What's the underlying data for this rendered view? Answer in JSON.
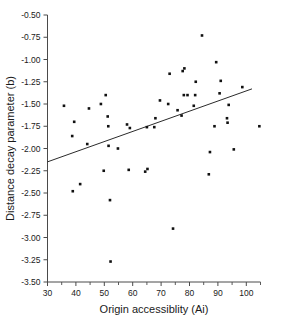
{
  "chart_data": {
    "type": "scatter",
    "title": "",
    "xlabel": "Origin accessiblity (Ai)",
    "ylabel": "Distance decay parameter (b)",
    "xlim": [
      30,
      105
    ],
    "ylim": [
      -3.5,
      -0.5
    ],
    "grid": false,
    "legend": null,
    "x_ticks": [
      30,
      40,
      50,
      60,
      70,
      80,
      90,
      100
    ],
    "x_tick_labels": [
      "30",
      "40",
      "50",
      "60",
      "70",
      "80",
      "90",
      "100"
    ],
    "x_minor_ticks": [
      35,
      45,
      55,
      65,
      75,
      85,
      95,
      105
    ],
    "y_ticks": [
      -0.5,
      -0.75,
      -1.0,
      -1.25,
      -1.5,
      -1.75,
      -2.0,
      -2.25,
      -2.5,
      -2.75,
      -3.0,
      -3.25,
      -3.5
    ],
    "y_tick_labels": [
      "-0.50",
      "-0.75",
      "-1.00",
      "-1.25",
      "-1.50",
      "-1.75",
      "-2.00",
      "-2.25",
      "-2.50",
      "-2.75",
      "-3.00",
      "-3.25",
      "-3.50"
    ],
    "marker": "square",
    "marker_color": "#111111",
    "points": [
      {
        "x": 35.8,
        "y": -1.52
      },
      {
        "x": 38.7,
        "y": -1.86
      },
      {
        "x": 38.9,
        "y": -2.48
      },
      {
        "x": 39.4,
        "y": -1.7
      },
      {
        "x": 41.5,
        "y": -2.4
      },
      {
        "x": 44.0,
        "y": -1.95
      },
      {
        "x": 44.6,
        "y": -1.55
      },
      {
        "x": 48.8,
        "y": -1.5
      },
      {
        "x": 49.8,
        "y": -2.25
      },
      {
        "x": 50.5,
        "y": -1.4
      },
      {
        "x": 51.2,
        "y": -1.64
      },
      {
        "x": 51.4,
        "y": -1.75
      },
      {
        "x": 51.5,
        "y": -1.97
      },
      {
        "x": 52.0,
        "y": -2.58
      },
      {
        "x": 52.2,
        "y": -3.27
      },
      {
        "x": 54.8,
        "y": -2.0
      },
      {
        "x": 58.0,
        "y": -1.73
      },
      {
        "x": 58.6,
        "y": -2.24
      },
      {
        "x": 59.0,
        "y": -1.77
      },
      {
        "x": 64.4,
        "y": -2.26
      },
      {
        "x": 65.0,
        "y": -1.76
      },
      {
        "x": 65.2,
        "y": -2.23
      },
      {
        "x": 67.6,
        "y": -1.76
      },
      {
        "x": 68.0,
        "y": -1.66
      },
      {
        "x": 69.6,
        "y": -1.46
      },
      {
        "x": 72.5,
        "y": -1.5
      },
      {
        "x": 73.0,
        "y": -1.16
      },
      {
        "x": 74.2,
        "y": -2.9
      },
      {
        "x": 75.8,
        "y": -1.57
      },
      {
        "x": 77.2,
        "y": -1.63
      },
      {
        "x": 77.6,
        "y": -1.13
      },
      {
        "x": 78.0,
        "y": -1.4
      },
      {
        "x": 78.2,
        "y": -1.1
      },
      {
        "x": 79.3,
        "y": -1.4
      },
      {
        "x": 81.5,
        "y": -1.52
      },
      {
        "x": 82.0,
        "y": -1.4
      },
      {
        "x": 82.2,
        "y": -1.25
      },
      {
        "x": 84.4,
        "y": -0.73
      },
      {
        "x": 86.8,
        "y": -2.29
      },
      {
        "x": 87.2,
        "y": -2.04
      },
      {
        "x": 88.8,
        "y": -1.75
      },
      {
        "x": 89.4,
        "y": -1.03
      },
      {
        "x": 90.6,
        "y": -1.38
      },
      {
        "x": 91.0,
        "y": -1.24
      },
      {
        "x": 93.2,
        "y": -1.66
      },
      {
        "x": 93.4,
        "y": -1.71
      },
      {
        "x": 93.8,
        "y": -1.51
      },
      {
        "x": 95.6,
        "y": -2.01
      },
      {
        "x": 98.6,
        "y": -1.31
      },
      {
        "x": 104.6,
        "y": -1.75
      }
    ],
    "trend_line": {
      "x_start": 30.0,
      "y_start": -2.15,
      "x_end": 102.0,
      "y_end": -1.33
    }
  }
}
